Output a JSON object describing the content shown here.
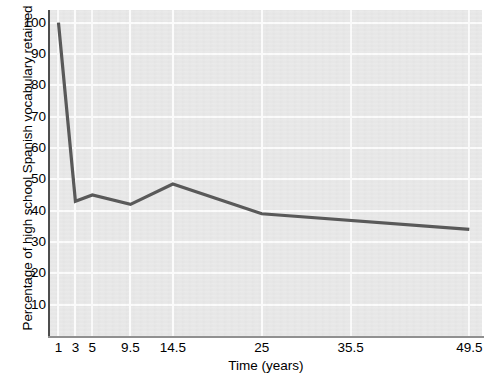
{
  "chart_data": {
    "type": "line",
    "title": "",
    "xlabel": "Time (years)",
    "ylabel": "Percentage of high school Spanish vocabulary retained",
    "xlim": [
      0,
      51
    ],
    "ylim": [
      0,
      104
    ],
    "grid": true,
    "legend": "none",
    "x_ticks": [
      "1",
      "3",
      "5",
      "9.5",
      "14.5",
      "25",
      "35.5",
      "49.5"
    ],
    "x_tick_values": [
      1,
      3,
      5,
      9.5,
      14.5,
      25,
      35.5,
      49.5
    ],
    "y_ticks": [
      "10",
      "20",
      "30",
      "40",
      "50",
      "60",
      "70",
      "80",
      "90",
      "100"
    ],
    "y_tick_values": [
      10,
      20,
      30,
      40,
      50,
      60,
      70,
      80,
      90,
      100
    ],
    "series": [
      {
        "name": "Spanish vocabulary retained",
        "color": "#595959",
        "x": [
          1,
          3,
          5,
          9.5,
          14.5,
          25,
          49.5
        ],
        "values": [
          100,
          43,
          45,
          42,
          48.5,
          39,
          34
        ]
      }
    ],
    "points": [
      {
        "x": 1,
        "y": 100
      },
      {
        "x": 3,
        "y": 43
      },
      {
        "x": 5,
        "y": 45
      },
      {
        "x": 9.5,
        "y": 42
      },
      {
        "x": 14.5,
        "y": 48.5
      },
      {
        "x": 25,
        "y": 39
      },
      {
        "x": 49.5,
        "y": 34
      }
    ]
  },
  "style": {
    "plot_background": "#e7e7e7",
    "gridline_color": "#fbfbfb",
    "line_color": "#595959",
    "axis_color": "#4d4d4d",
    "text_color": "#000000",
    "page_background": "#ffffff"
  }
}
